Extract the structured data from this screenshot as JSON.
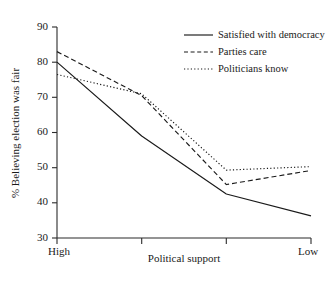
{
  "chart_data": {
    "type": "line",
    "title": "",
    "xlabel": "Political support",
    "ylabel": "% Believing election was fair",
    "ylim": [
      30,
      90
    ],
    "yticks": [
      30,
      40,
      50,
      60,
      70,
      80,
      90
    ],
    "ytick_labels": [
      "30",
      "40",
      "50",
      "60",
      "70",
      "80",
      "90"
    ],
    "x": [
      1,
      2,
      3,
      4
    ],
    "xtick_labels": [
      "High",
      "",
      "",
      "Low"
    ],
    "categories": [
      "High",
      "",
      "",
      "Low"
    ],
    "grid": false,
    "legend_position": "top-right",
    "series": [
      {
        "name": "Satisfied with democracy",
        "style": "solid",
        "color": "#1a1a1a",
        "values": [
          80.0,
          59.0,
          42.5,
          36.3
        ]
      },
      {
        "name": "Parties care",
        "style": "dashed",
        "color": "#1a1a1a",
        "values": [
          83.0,
          70.5,
          45.2,
          49.2
        ]
      },
      {
        "name": "Politicians know",
        "style": "dotted",
        "color": "#1a1a1a",
        "values": [
          76.5,
          71.0,
          49.3,
          50.3
        ]
      }
    ]
  },
  "axes": {
    "y_title": "% Believing election was fair",
    "x_title": "Political support",
    "y_tick_0": "30",
    "y_tick_1": "40",
    "y_tick_2": "50",
    "y_tick_3": "60",
    "y_tick_4": "70",
    "y_tick_5": "80",
    "y_tick_6": "90",
    "x_tick_left": "High",
    "x_tick_right": "Low"
  },
  "legend": {
    "entries": [
      {
        "label": "Satisfied with democracy",
        "style": "solid"
      },
      {
        "label": "Parties care",
        "style": "dashed"
      },
      {
        "label": "Politicians know",
        "style": "dotted"
      }
    ],
    "entry_0_label": "Satisfied with democracy",
    "entry_1_label": "Parties care",
    "entry_2_label": "Politicians know"
  }
}
